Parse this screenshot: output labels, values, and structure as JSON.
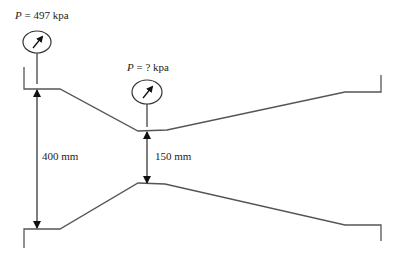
{
  "diagram": {
    "type": "venturi-meter",
    "labels": {
      "inlet_pressure": {
        "var": "P",
        "eq": " = ",
        "value": "497 kpa"
      },
      "throat_pressure": {
        "var": "P",
        "eq": " = ",
        "value": "? kpa"
      },
      "inlet_diameter": "400 mm",
      "throat_diameter": "150 mm"
    },
    "colors": {
      "line": "#555555",
      "arrow": "#111111",
      "text": "#222222",
      "background": "#ffffff"
    }
  }
}
